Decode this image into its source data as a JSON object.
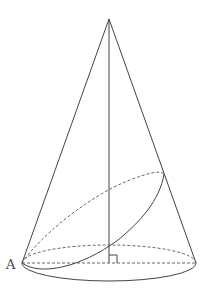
{
  "figure": {
    "type": "cone-with-oblique-section",
    "colors": {
      "stroke": "#444444",
      "dashed": "#666666",
      "background": "#ffffff"
    },
    "apex": {
      "x": 109,
      "y": 19
    },
    "base": {
      "cx": 109,
      "cy": 263,
      "rx": 87,
      "ry": 18
    },
    "oblique_section": {
      "start": {
        "x": 22,
        "y": 263
      },
      "end": {
        "x": 164,
        "y": 174
      }
    },
    "labels": [
      {
        "id": "A",
        "text": "A",
        "x": 6,
        "y": 258
      }
    ],
    "right_angle_mark": {
      "x": 109,
      "y": 263,
      "size": 8
    }
  }
}
